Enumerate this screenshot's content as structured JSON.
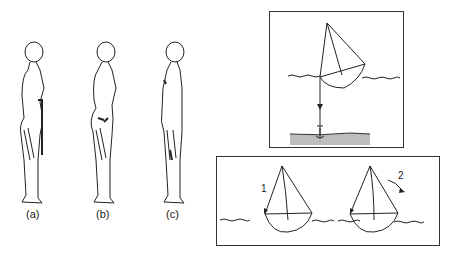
{
  "figures": {
    "postures": [
      {
        "label": "(a)",
        "x": 33
      },
      {
        "label": "(b)",
        "x": 103
      },
      {
        "label": "(c)",
        "x": 172
      }
    ],
    "anchored_boat": {
      "description": "Sailboat anchored with line to seabed"
    },
    "boats": {
      "arrow_1_label": "1",
      "arrow_2_label": "2"
    }
  },
  "colors": {
    "stroke": "#222222",
    "seabed": "#bdbdbd"
  }
}
